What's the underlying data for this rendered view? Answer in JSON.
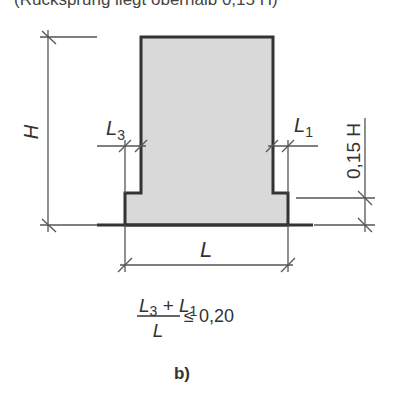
{
  "caption_top": "(Rücksprung liegt oberhalb 0,15 H)",
  "labels": {
    "H": "H",
    "L3": "L",
    "L3_sub": "3",
    "L1": "L",
    "L1_sub": "1",
    "height_frac": "0,15 H",
    "L": "L"
  },
  "formula": {
    "numerator_a": "L",
    "numerator_a_sub": "3",
    "plus": " + ",
    "numerator_b": "L",
    "numerator_b_sub": "1",
    "denominator": "L",
    "relation": "≤ 0,20"
  },
  "subfigure_label": "b)",
  "colors": {
    "fill": "#d9d9d9",
    "outline": "#333333",
    "dimension": "#555555"
  }
}
